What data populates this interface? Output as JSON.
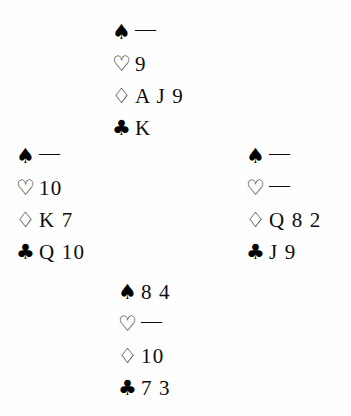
{
  "diagram": {
    "type": "bridge-hand-diagram",
    "layout": "compass-four-hand",
    "void_marker": "—",
    "suit_order": [
      "spades",
      "hearts",
      "diamonds",
      "clubs"
    ],
    "symbols": {
      "spades": "♠",
      "hearts": "♡",
      "diamonds": "♢",
      "clubs": "♣"
    }
  },
  "hands": {
    "north": {
      "position": "North",
      "spades": "—",
      "hearts": "9",
      "diamonds": "A J 9",
      "clubs": "K"
    },
    "west": {
      "position": "West",
      "spades": "—",
      "hearts": "10",
      "diamonds": "K 7",
      "clubs": "Q 10"
    },
    "east": {
      "position": "East",
      "spades": "—",
      "hearts": "—",
      "diamonds": "Q 8 2",
      "clubs": "J 9"
    },
    "south": {
      "position": "South",
      "spades": "8 4",
      "hearts": "—",
      "diamonds": "10",
      "clubs": "7 3"
    }
  }
}
